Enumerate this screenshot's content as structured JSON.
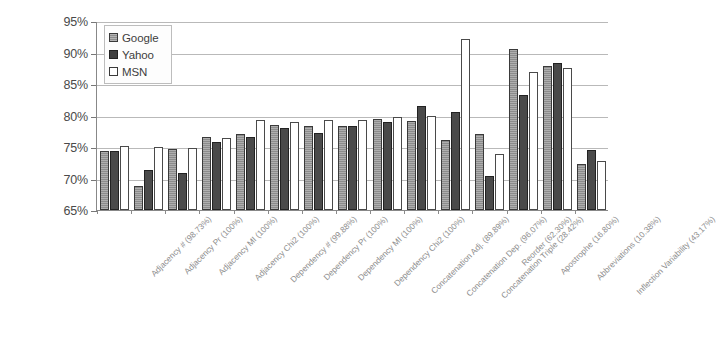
{
  "chart_data": {
    "type": "bar",
    "title": "",
    "subtitle": "",
    "xlabel": "",
    "ylabel": "",
    "ylim": [
      65,
      95
    ],
    "ytick_labels": [
      "95%",
      "90%",
      "85%",
      "80%",
      "75%",
      "70%",
      "65%"
    ],
    "ytick_values": [
      95,
      90,
      85,
      80,
      75,
      70,
      65
    ],
    "grid": true,
    "legend_position": "top-left",
    "categories": [
      "Adjacency # (98.73%)",
      "Adjacency Pr (100%)",
      "Adjacency MI (100%)",
      "Adjacency Chi2 (100%)",
      "Dependency # (99.88%)",
      "Dependency Pr (100%)",
      "Dependency MI (100%)",
      "Dependency Chi2 (100%)",
      "Concatenation Adj. (89.89%)",
      "Concatenation Dep. (96.07%)",
      "Concatenation Triple (28.42%)",
      "Reorder (62.30%)",
      "Apostrophe (16.80%)",
      "Abbreviations (10.38%)",
      "Inflection Variability (43.17%)"
    ],
    "series": [
      {
        "name": "Google",
        "color": "#8c8c8c",
        "values": [
          74.3,
          68.8,
          74.7,
          76.6,
          77.0,
          78.5,
          78.3,
          78.4,
          79.4,
          79.2,
          76.1,
          77.1,
          90.6,
          87.9,
          72.3
        ]
      },
      {
        "name": "Yahoo",
        "color": "#4a4a4a",
        "values": [
          74.3,
          71.3,
          70.9,
          75.8,
          76.6,
          78.0,
          77.3,
          78.4,
          78.9,
          81.5,
          80.5,
          70.4,
          83.2,
          88.3,
          74.6
        ]
      },
      {
        "name": "MSN",
        "color": "#ffffff",
        "values": [
          75.2,
          75.0,
          74.8,
          76.4,
          79.3,
          79.0,
          79.3,
          79.3,
          79.7,
          79.9,
          92.1,
          73.9,
          86.9,
          87.6,
          72.8
        ]
      }
    ]
  },
  "legend": {
    "items": [
      {
        "label": "Google",
        "swatch": "google-swatch"
      },
      {
        "label": "Yahoo",
        "swatch": "yahoo-swatch"
      },
      {
        "label": "MSN",
        "swatch": "msn-swatch"
      }
    ]
  }
}
